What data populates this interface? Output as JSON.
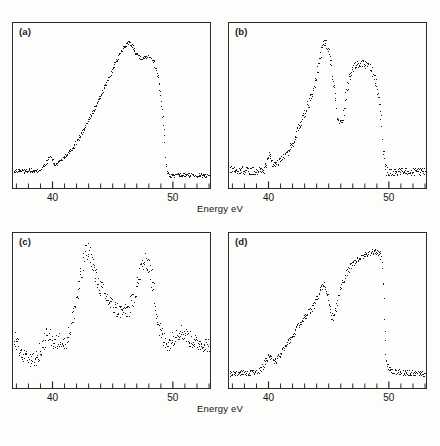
{
  "figure": {
    "background_color": "#fdfdfc",
    "ink_color": "#1a1a1a",
    "frame_color": "#2b2b2b"
  },
  "axis": {
    "xlabel": "Energy eV",
    "xlabel_top": "Energy eV",
    "xlabel_bottom": "Energy eV",
    "tick_labels": [
      "40",
      "50"
    ],
    "tick_values": [
      40,
      50
    ],
    "minor_tick_step": 1,
    "xmin": 36.8,
    "xmax": 53.0
  },
  "panels": [
    {
      "id": "a",
      "label": "(a)"
    },
    {
      "id": "b",
      "label": "(b)"
    },
    {
      "id": "c",
      "label": "(c)"
    },
    {
      "id": "d",
      "label": "(d)"
    }
  ],
  "chart_data": [
    {
      "type": "scatter",
      "panel": "(a)",
      "title": "",
      "xlabel": "Energy eV",
      "ylabel": "",
      "xlim": [
        36.8,
        53.0
      ],
      "ylim": [
        0,
        1.05
      ],
      "grid": false,
      "legend": "none",
      "x": [
        36.9,
        37.1,
        37.3,
        37.5,
        37.7,
        37.9,
        38.1,
        38.3,
        38.5,
        38.7,
        38.9,
        39.1,
        39.3,
        39.5,
        39.7,
        39.8,
        39.9,
        40.0,
        40.1,
        40.2,
        40.35,
        40.5,
        40.7,
        40.9,
        41.1,
        41.3,
        41.5,
        41.7,
        41.9,
        42.1,
        42.3,
        42.5,
        42.7,
        42.9,
        43.1,
        43.3,
        43.5,
        43.7,
        43.9,
        44.1,
        44.3,
        44.5,
        44.7,
        44.9,
        45.1,
        45.3,
        45.5,
        45.7,
        45.9,
        46.1,
        46.3,
        46.5,
        46.7,
        46.9,
        47.1,
        47.3,
        47.5,
        47.6,
        47.8,
        48.0,
        48.2,
        48.4,
        48.6,
        48.8,
        49.0,
        49.2,
        49.35,
        49.45,
        49.5,
        49.55,
        49.6,
        49.7,
        49.9,
        50.1,
        50.4,
        50.7,
        51.0,
        51.4,
        51.8,
        52.2,
        52.6,
        52.9
      ],
      "y": [
        0.075,
        0.082,
        0.086,
        0.083,
        0.079,
        0.084,
        0.088,
        0.083,
        0.078,
        0.082,
        0.089,
        0.098,
        0.115,
        0.14,
        0.168,
        0.18,
        0.176,
        0.158,
        0.135,
        0.122,
        0.13,
        0.142,
        0.158,
        0.172,
        0.188,
        0.205,
        0.222,
        0.242,
        0.265,
        0.292,
        0.318,
        0.348,
        0.378,
        0.41,
        0.442,
        0.475,
        0.508,
        0.542,
        0.578,
        0.612,
        0.648,
        0.685,
        0.722,
        0.758,
        0.795,
        0.832,
        0.868,
        0.898,
        0.925,
        0.948,
        0.962,
        0.955,
        0.932,
        0.902,
        0.878,
        0.862,
        0.855,
        0.858,
        0.868,
        0.872,
        0.862,
        0.835,
        0.79,
        0.72,
        0.6,
        0.43,
        0.25,
        0.14,
        0.095,
        0.07,
        0.058,
        0.052,
        0.05,
        0.05,
        0.051,
        0.052,
        0.052,
        0.053,
        0.053,
        0.052,
        0.052,
        0.051
      ]
    },
    {
      "type": "scatter",
      "panel": "(b)",
      "title": "",
      "xlabel": "Energy eV",
      "ylabel": "",
      "xlim": [
        36.8,
        53.0
      ],
      "ylim": [
        0,
        1.05
      ],
      "grid": false,
      "legend": "none",
      "x": [
        36.9,
        37.1,
        37.3,
        37.5,
        37.7,
        37.9,
        38.1,
        38.3,
        38.5,
        38.7,
        38.9,
        39.1,
        39.3,
        39.5,
        39.7,
        39.85,
        40.0,
        40.1,
        40.2,
        40.35,
        40.5,
        40.65,
        40.8,
        41.0,
        41.2,
        41.4,
        41.6,
        41.8,
        42.0,
        42.2,
        42.4,
        42.6,
        42.8,
        43.0,
        43.2,
        43.4,
        43.6,
        43.8,
        44.0,
        44.2,
        44.4,
        44.6,
        44.8,
        45.0,
        45.2,
        45.4,
        45.55,
        45.7,
        45.85,
        46.0,
        46.15,
        46.3,
        46.45,
        46.6,
        46.8,
        47.0,
        47.2,
        47.4,
        47.6,
        47.8,
        48.0,
        48.2,
        48.4,
        48.6,
        48.8,
        49.0,
        49.2,
        49.4,
        49.55,
        49.65,
        49.75,
        49.85,
        50.0,
        50.2,
        50.5,
        50.8,
        51.2,
        51.6,
        52.0,
        52.4,
        52.7,
        52.9
      ],
      "y": [
        0.085,
        0.092,
        0.086,
        0.09,
        0.083,
        0.088,
        0.082,
        0.086,
        0.08,
        0.083,
        0.078,
        0.082,
        0.08,
        0.085,
        0.098,
        0.13,
        0.175,
        0.19,
        0.165,
        0.138,
        0.128,
        0.132,
        0.138,
        0.15,
        0.168,
        0.188,
        0.212,
        0.24,
        0.272,
        0.308,
        0.348,
        0.392,
        0.438,
        0.482,
        0.52,
        0.558,
        0.602,
        0.658,
        0.728,
        0.81,
        0.89,
        0.948,
        0.965,
        0.92,
        0.82,
        0.69,
        0.57,
        0.48,
        0.43,
        0.41,
        0.435,
        0.5,
        0.59,
        0.675,
        0.745,
        0.79,
        0.812,
        0.82,
        0.818,
        0.822,
        0.815,
        0.805,
        0.79,
        0.77,
        0.735,
        0.67,
        0.56,
        0.4,
        0.24,
        0.15,
        0.1,
        0.08,
        0.072,
        0.07,
        0.072,
        0.074,
        0.073,
        0.075,
        0.074,
        0.076,
        0.075,
        0.077
      ]
    },
    {
      "type": "scatter",
      "panel": "(c)",
      "title": "",
      "xlabel": "Energy eV",
      "ylabel": "",
      "xlim": [
        36.8,
        53.0
      ],
      "ylim": [
        0,
        1.05
      ],
      "grid": false,
      "legend": "none",
      "x": [
        36.9,
        37.1,
        37.3,
        37.5,
        37.7,
        37.9,
        38.1,
        38.3,
        38.5,
        38.7,
        38.9,
        39.1,
        39.3,
        39.5,
        39.65,
        39.8,
        39.95,
        40.1,
        40.25,
        40.4,
        40.55,
        40.7,
        40.85,
        41.0,
        41.2,
        41.4,
        41.6,
        41.8,
        42.0,
        42.2,
        42.4,
        42.6,
        42.8,
        43.0,
        43.2,
        43.4,
        43.6,
        43.8,
        44.0,
        44.2,
        44.4,
        44.6,
        44.8,
        45.0,
        45.2,
        45.4,
        45.6,
        45.8,
        46.0,
        46.2,
        46.4,
        46.6,
        46.8,
        47.0,
        47.2,
        47.4,
        47.6,
        47.8,
        48.0,
        48.2,
        48.4,
        48.6,
        48.8,
        49.0,
        49.2,
        49.4,
        49.6,
        49.8,
        50.0,
        50.2,
        50.4,
        50.6,
        50.8,
        51.0,
        51.2,
        51.4,
        51.6,
        51.8,
        52.0,
        52.3,
        52.6,
        52.9
      ],
      "y": [
        0.31,
        0.268,
        0.235,
        0.205,
        0.188,
        0.172,
        0.162,
        0.158,
        0.168,
        0.185,
        0.215,
        0.255,
        0.3,
        0.335,
        0.352,
        0.34,
        0.312,
        0.29,
        0.282,
        0.3,
        0.32,
        0.318,
        0.3,
        0.292,
        0.32,
        0.372,
        0.44,
        0.52,
        0.61,
        0.7,
        0.79,
        0.88,
        0.95,
        0.985,
        0.935,
        0.855,
        0.78,
        0.73,
        0.7,
        0.672,
        0.64,
        0.612,
        0.588,
        0.565,
        0.548,
        0.535,
        0.528,
        0.522,
        0.52,
        0.528,
        0.548,
        0.585,
        0.64,
        0.71,
        0.78,
        0.84,
        0.882,
        0.9,
        0.87,
        0.79,
        0.68,
        0.56,
        0.45,
        0.368,
        0.318,
        0.295,
        0.288,
        0.3,
        0.325,
        0.348,
        0.368,
        0.378,
        0.372,
        0.358,
        0.34,
        0.322,
        0.308,
        0.298,
        0.292,
        0.288,
        0.285,
        0.282
      ]
    },
    {
      "type": "scatter",
      "panel": "(d)",
      "title": "",
      "xlabel": "Energy eV",
      "ylabel": "",
      "xlim": [
        36.8,
        53.0
      ],
      "ylim": [
        0,
        1.05
      ],
      "grid": false,
      "legend": "none",
      "x": [
        36.9,
        37.1,
        37.3,
        37.5,
        37.7,
        37.9,
        38.1,
        38.3,
        38.5,
        38.7,
        38.9,
        39.1,
        39.3,
        39.5,
        39.7,
        39.9,
        40.05,
        40.2,
        40.35,
        40.5,
        40.65,
        40.8,
        41.0,
        41.2,
        41.4,
        41.6,
        41.8,
        42.0,
        42.2,
        42.4,
        42.6,
        42.8,
        43.0,
        43.2,
        43.4,
        43.6,
        43.8,
        44.0,
        44.2,
        44.4,
        44.6,
        44.8,
        44.95,
        45.1,
        45.25,
        45.4,
        45.55,
        45.7,
        45.85,
        46.0,
        46.2,
        46.4,
        46.6,
        46.8,
        47.0,
        47.2,
        47.4,
        47.6,
        47.8,
        48.0,
        48.2,
        48.4,
        48.6,
        48.8,
        49.0,
        49.2,
        49.35,
        49.5,
        49.6,
        49.7,
        49.8,
        50.0,
        50.2,
        50.5,
        50.8,
        51.1,
        51.5,
        51.9,
        52.3,
        52.6,
        52.8,
        52.95
      ],
      "y": [
        0.068,
        0.072,
        0.07,
        0.074,
        0.068,
        0.072,
        0.069,
        0.073,
        0.07,
        0.074,
        0.071,
        0.078,
        0.092,
        0.118,
        0.148,
        0.18,
        0.205,
        0.19,
        0.168,
        0.152,
        0.168,
        0.192,
        0.215,
        0.238,
        0.262,
        0.288,
        0.318,
        0.348,
        0.378,
        0.408,
        0.438,
        0.462,
        0.48,
        0.5,
        0.522,
        0.545,
        0.572,
        0.608,
        0.652,
        0.7,
        0.735,
        0.705,
        0.64,
        0.56,
        0.495,
        0.475,
        0.515,
        0.58,
        0.648,
        0.7,
        0.742,
        0.782,
        0.818,
        0.848,
        0.872,
        0.89,
        0.902,
        0.912,
        0.925,
        0.938,
        0.948,
        0.952,
        0.958,
        0.96,
        0.955,
        0.95,
        0.93,
        0.82,
        0.6,
        0.35,
        0.18,
        0.098,
        0.082,
        0.078,
        0.076,
        0.074,
        0.072,
        0.07,
        0.068,
        0.066,
        0.064,
        0.063
      ]
    }
  ]
}
